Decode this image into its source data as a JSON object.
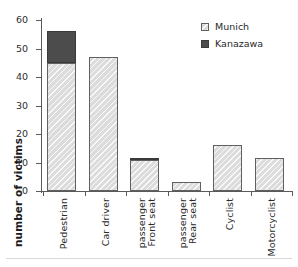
{
  "chart_data": {
    "type": "bar",
    "stacked": true,
    "title": "",
    "subtitle": "",
    "xlabel": "",
    "ylabel": "number of victims",
    "ylim": [
      0,
      60
    ],
    "ytick_values": [
      0,
      10,
      20,
      30,
      40,
      50,
      60
    ],
    "ytick_labels": [
      "0",
      "10",
      "20",
      "30",
      "40",
      "50",
      "60"
    ],
    "grid": false,
    "legend_position": "top-right",
    "categories": [
      "Pedestrian",
      "Car driver",
      "Front seat passenger",
      "Rear seat passenger",
      "Cyclist",
      "Motorcyclist"
    ],
    "category_lines": [
      [
        "Pedestrian"
      ],
      [
        "Car driver"
      ],
      [
        "passenger",
        "Front seat"
      ],
      [
        "passenger",
        "Rear seat"
      ],
      [
        "Cyclist"
      ],
      [
        "Motorcyclist"
      ]
    ],
    "series": [
      {
        "name": "Munich",
        "color": "#dcdcdc",
        "values": [
          45,
          47,
          11,
          3,
          16,
          11.5
        ]
      },
      {
        "name": "Kanazawa",
        "color": "#4c4c4c",
        "values": [
          11,
          0,
          0.7,
          0,
          0,
          0
        ]
      }
    ],
    "totals": [
      56,
      47,
      11.7,
      3,
      16,
      11.5
    ]
  },
  "legend": {
    "entries": [
      {
        "label": "Munich",
        "swatch": "munich"
      },
      {
        "label": "Kanazawa",
        "swatch": "kanazawa"
      }
    ]
  },
  "axes": {
    "y_title": "number of victims"
  }
}
